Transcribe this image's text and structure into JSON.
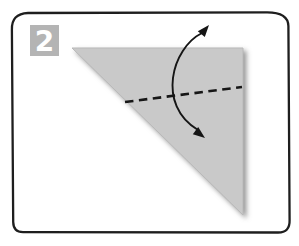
{
  "figure": {
    "step_number": "2",
    "colors": {
      "background": "#ffffff",
      "frame_stroke": "#1e1e1e",
      "badge_fill": "#b4b4b4",
      "badge_number": "#ffffff",
      "paper_fill": "#c9c9c9",
      "paper_edge": "#b9b9b9",
      "fold_line": "#161616",
      "arrow": "#151515"
    }
  }
}
